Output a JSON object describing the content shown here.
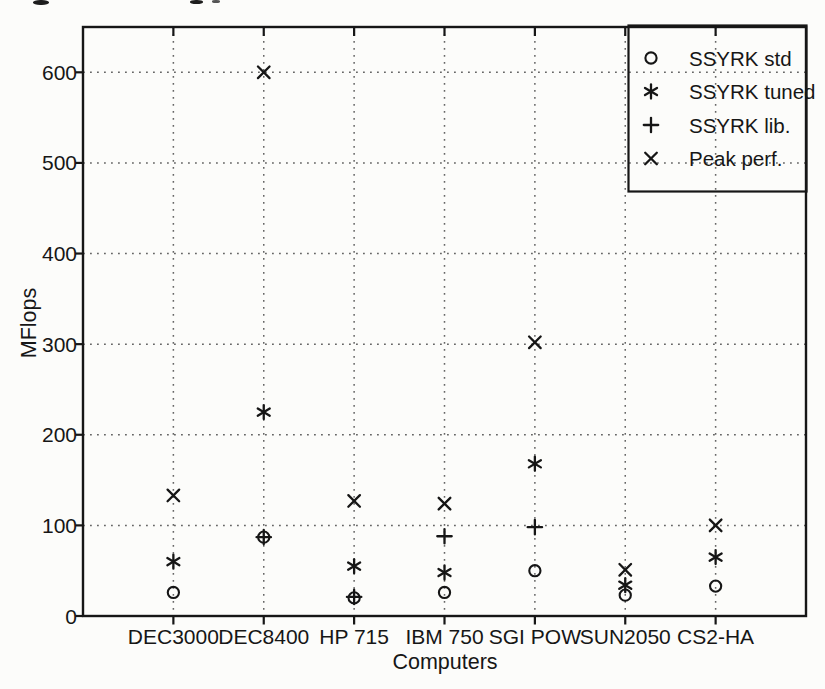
{
  "figure": {
    "xlabel": "Computers",
    "ylabel": "MFlops",
    "ink_color": "#161616",
    "grid_color": "#4d4d4d",
    "background": "#fcfcfa"
  },
  "legend": {
    "position": "top-right",
    "items": [
      {
        "marker": "circle-icon",
        "label": "SSYRK std"
      },
      {
        "marker": "asterisk-icon",
        "label": "SSYRK tuned"
      },
      {
        "marker": "plus-icon",
        "label": "SSYRK lib."
      },
      {
        "marker": "x-icon",
        "label": "Peak perf."
      }
    ]
  },
  "chart_data": {
    "type": "scatter",
    "categories": [
      "DEC3000",
      "DEC8400",
      "HP 715",
      "IBM 750",
      "SGI POW",
      "SUN2050",
      "CS2-HA"
    ],
    "series": [
      {
        "name": "SSYRK std",
        "marker": "circle",
        "values": [
          26,
          87,
          20,
          26,
          50,
          23,
          33
        ]
      },
      {
        "name": "SSYRK tuned",
        "marker": "asterisk",
        "values": [
          60,
          225,
          55,
          48,
          168,
          34,
          65
        ]
      },
      {
        "name": "SSYRK lib.",
        "marker": "plus",
        "values": [
          null,
          87,
          21,
          88,
          98,
          null,
          null
        ]
      },
      {
        "name": "Peak perf.",
        "marker": "x",
        "values": [
          133,
          600,
          127,
          124,
          302,
          51,
          100
        ]
      }
    ],
    "xlabel": "Computers",
    "ylabel": "MFlops",
    "ylim": [
      0,
      650
    ],
    "yticks": [
      0,
      100,
      200,
      300,
      400,
      500,
      600
    ],
    "grid": "dotted-both-axes",
    "legend_position": "top-right"
  }
}
